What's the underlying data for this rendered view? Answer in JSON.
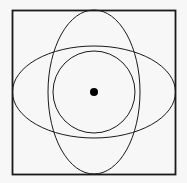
{
  "diagram": {
    "background": "#f7f7f7",
    "stroke": "#1a1a1a",
    "square": {
      "x": 12.5,
      "y": 10.5,
      "width": 163,
      "height": 164,
      "stroke_width": 1.8
    },
    "vertical_ellipse": {
      "cx": 94,
      "cy": 92,
      "rx": 46,
      "ry": 82,
      "stroke_width": 1
    },
    "horizontal_ellipse": {
      "cx": 94,
      "cy": 92,
      "rx": 81.5,
      "ry": 46,
      "stroke_width": 1
    },
    "circle": {
      "cx": 94,
      "cy": 92,
      "r": 41,
      "stroke_width": 1
    },
    "center_dot": {
      "cx": 94,
      "cy": 92,
      "r": 4,
      "fill": "#000000"
    }
  }
}
